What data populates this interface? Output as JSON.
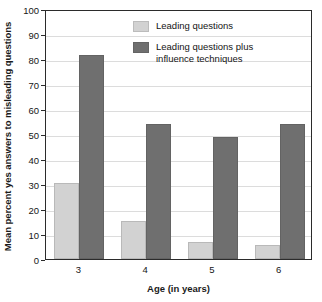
{
  "chart_data": {
    "type": "bar",
    "title": "",
    "xlabel": "Age (in years)",
    "ylabel": "Mean percent yes answers to misleading questions",
    "categories": [
      "3",
      "4",
      "5",
      "6"
    ],
    "series": [
      {
        "name": "Leading questions",
        "color": "#d2d2d2",
        "values": [
          30.5,
          15.3,
          7.0,
          5.5
        ]
      },
      {
        "name": "Leading questions plus\ninfluence techniques",
        "color": "#6f6f6f",
        "values": [
          81.5,
          54.2,
          48.8,
          54.0
        ]
      }
    ],
    "ylim": [
      0,
      100
    ],
    "ytick_labels": [
      "0",
      "10",
      "20",
      "30",
      "40",
      "50",
      "60",
      "70",
      "80",
      "90",
      "100"
    ],
    "ytick_values": [
      0,
      10,
      20,
      30,
      40,
      50,
      60,
      70,
      80,
      90,
      100
    ],
    "grid": true,
    "grid_axis": "y",
    "legend_position": "top-center",
    "frame": true
  }
}
